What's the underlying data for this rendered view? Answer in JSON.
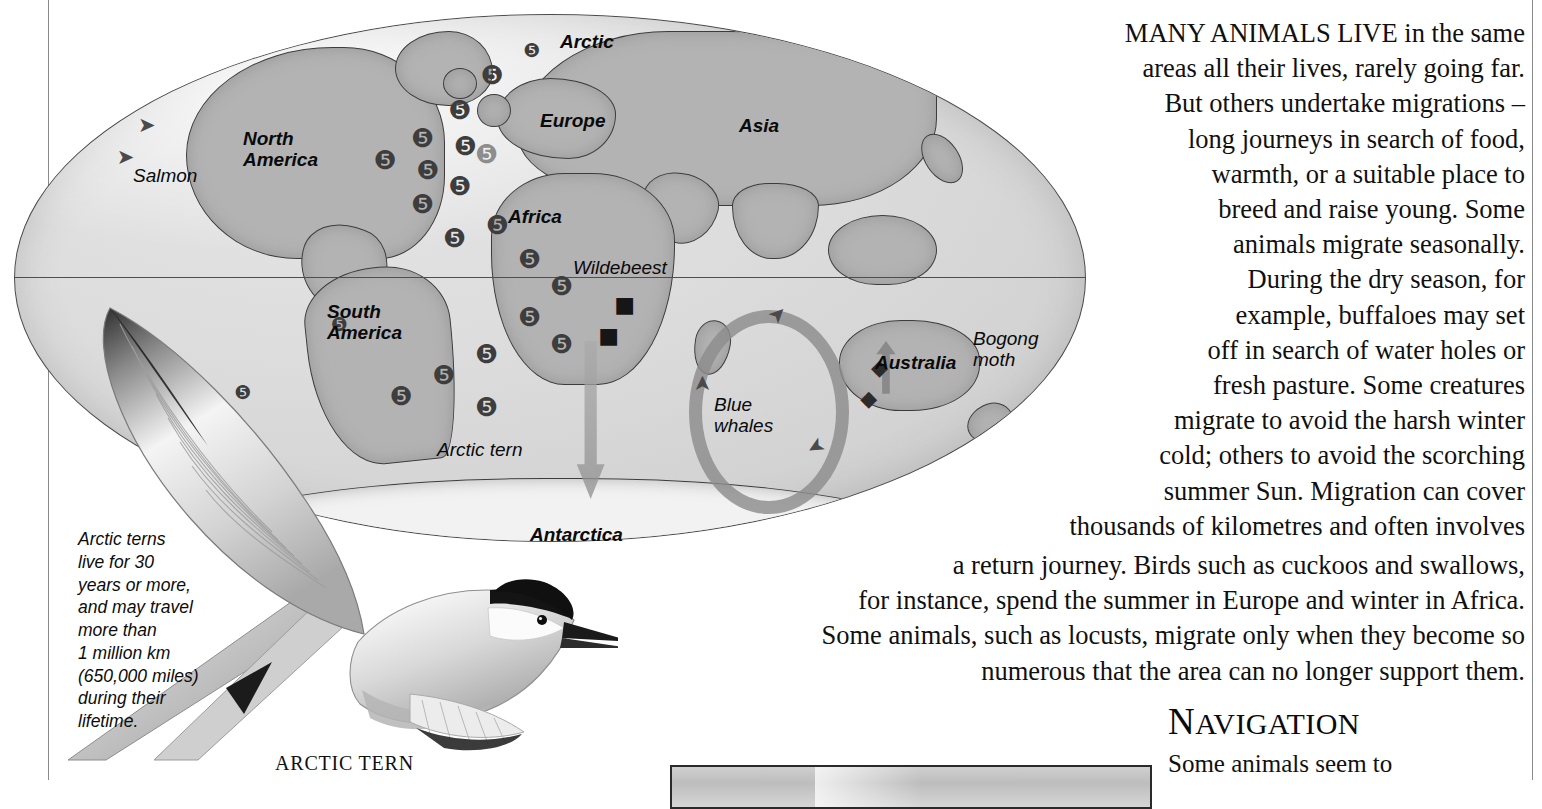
{
  "map": {
    "continents": [
      {
        "name": "Arctic",
        "x": 560,
        "y": 27
      },
      {
        "name": "North\nAmerica",
        "x": 243,
        "y": 124
      },
      {
        "name": "Europe",
        "x": 540,
        "y": 106
      },
      {
        "name": "Asia",
        "x": 739,
        "y": 111
      },
      {
        "name": "Africa",
        "x": 508,
        "y": 202
      },
      {
        "name": "South\nAmerica",
        "x": 327,
        "y": 297
      },
      {
        "name": "Australia",
        "x": 875,
        "y": 348
      },
      {
        "name": "Antarctica",
        "x": 530,
        "y": 520
      }
    ],
    "animals": [
      {
        "name": "Salmon",
        "x": 133,
        "y": 161
      },
      {
        "name": "Wildebeest",
        "x": 573,
        "y": 253
      },
      {
        "name": "Arctic tern",
        "x": 437,
        "y": 435
      },
      {
        "name": "Blue\nwhales",
        "x": 714,
        "y": 390
      },
      {
        "name": "Bogong\nmoth",
        "x": 973,
        "y": 324
      }
    ]
  },
  "tern": {
    "note": "Arctic terns\nlive for 30\nyears or more,\nand may travel\nmore than\n1 million km\n(650,000 miles)\nduring their\nlifetime.",
    "caption": "ARCTIC TERN"
  },
  "article": {
    "lead_caps": "MANY ANIMALS LIVE",
    "paragraph1": "MANY ANIMALS LIVE in the same\nareas all their lives, rarely going far.\nBut others undertake migrations –\nlong journeys in search of food,\nwarmth, or a suitable place to\nbreed and raise young. Some\nanimals migrate seasonally.\nDuring the dry season, for\nexample, buffaloes may set\noff in search of water holes or\nfresh pasture. Some creatures\nmigrate to avoid the harsh winter\ncold; others to avoid the scorching\nsummer Sun. Migration can cover\nthousands of kilometres and often involves",
    "paragraph2": "a return journey. Birds such as cuckoos and swallows,\nfor instance, spend the summer in Europe and winter in Africa.\nSome animals, such as locusts, migrate only when they become so\nnumerous that the area can no longer support them."
  },
  "navigation": {
    "heading_first": "N",
    "heading_rest": "AVIGATION",
    "body": "Some animals seem to"
  },
  "colors": {
    "ocean": "#d8d8d8",
    "land": "#b3b3b3",
    "outline": "#3c3c3c",
    "text": "#101010",
    "rule": "#8a8a8a"
  }
}
